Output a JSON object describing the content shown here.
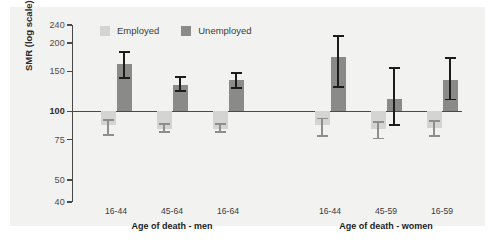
{
  "figure": {
    "background": "#f2f2f1",
    "ylabel": "SMR (log scale)"
  },
  "legend": {
    "items": [
      {
        "label": "Employed",
        "color": "#d4d4d2"
      },
      {
        "label": "Unemployed",
        "color": "#8a8a88"
      }
    ]
  },
  "chart_data": {
    "type": "bar",
    "title": "",
    "xlabel": "",
    "ylabel": "SMR (log scale)",
    "yscale": "log",
    "ylim": [
      40,
      240
    ],
    "yticks": [
      40,
      50,
      75,
      100,
      150,
      200,
      240
    ],
    "ytick_labels": [
      "40",
      "50",
      "75",
      "100",
      "150",
      "200",
      "240"
    ],
    "reference_line": 100,
    "grid": false,
    "legend_position": "top-center",
    "groups": [
      {
        "name": "Age of death - men",
        "categories": [
          "16-44",
          "45-64",
          "16-64"
        ]
      },
      {
        "name": "Age of death - women",
        "categories": [
          "16-44",
          "45-59",
          "16-59"
        ]
      }
    ],
    "categories": [
      "16-44",
      "45-64",
      "16-64",
      "16-44",
      "45-59",
      "16-59"
    ],
    "series": [
      {
        "name": "Employed",
        "color": "#d4d4d2",
        "values": [
          87,
          84,
          84,
          87,
          84,
          85
        ],
        "ci_low": [
          79,
          81,
          81,
          78,
          76,
          78
        ],
        "ci_high": [
          92,
          88,
          88,
          93,
          90,
          91
        ]
      },
      {
        "name": "Unemployed",
        "color": "#8a8a88",
        "values": [
          162,
          131,
          137,
          174,
          114,
          137
        ],
        "ci_low": [
          140,
          123,
          127,
          128,
          87,
          113
        ],
        "ci_high": [
          183,
          142,
          148,
          215,
          155,
          172
        ]
      }
    ]
  }
}
